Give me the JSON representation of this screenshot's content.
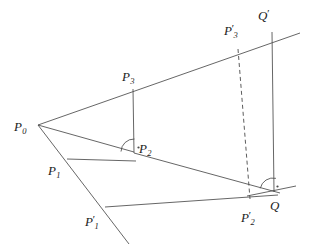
{
  "figure": {
    "background": "#ffffff",
    "stroke_color": "#4a4a4a",
    "label_color": "#222222",
    "width": 312,
    "height": 251,
    "points": [
      {
        "id": "P0",
        "base": "P",
        "sub": "0",
        "prime": false,
        "x": 38,
        "y": 125,
        "label_x": 14,
        "label_y": 118
      },
      {
        "id": "P1",
        "base": "P",
        "sub": "1",
        "prime": false,
        "x": 67,
        "y": 159,
        "label_x": 48,
        "label_y": 162
      },
      {
        "id": "P2",
        "base": "P",
        "sub": "2",
        "prime": false,
        "x": 134,
        "y": 152,
        "label_x": 139,
        "label_y": 140
      },
      {
        "id": "P3",
        "base": "P",
        "sub": "3",
        "prime": false,
        "x": 133,
        "y": 89,
        "label_x": 122,
        "label_y": 68
      },
      {
        "id": "P1p",
        "base": "P",
        "sub": "1",
        "prime": true,
        "x": 105,
        "y": 207,
        "label_x": 85,
        "label_y": 213
      },
      {
        "id": "P2p",
        "base": "P",
        "sub": "2",
        "prime": true,
        "x": 250,
        "y": 197,
        "label_x": 241,
        "label_y": 209
      },
      {
        "id": "P3p",
        "base": "P",
        "sub": "3",
        "prime": true,
        "x": 238,
        "y": 49,
        "label_x": 224,
        "label_y": 22
      },
      {
        "id": "Q",
        "base": "Q",
        "sub": "",
        "prime": false,
        "x": 273,
        "y": 191,
        "label_x": 270,
        "label_y": 197
      },
      {
        "id": "Qp",
        "base": "Q",
        "sub": "",
        "prime": true,
        "x": 272,
        "y": 32,
        "label_x": 258,
        "label_y": 7
      }
    ],
    "segments": [
      {
        "name": "ray-p0-to-qprime",
        "x1": 38,
        "y1": 125,
        "x2": 300,
        "y2": 33,
        "dashed": false
      },
      {
        "name": "segment-p0-to-p2",
        "x1": 38,
        "y1": 125,
        "x2": 134,
        "y2": 152,
        "dashed": false
      },
      {
        "name": "ray-p0-through-p1",
        "x1": 38,
        "y1": 125,
        "x2": 129,
        "y2": 244,
        "dashed": false
      },
      {
        "name": "segment-p3-to-p2",
        "x1": 133,
        "y1": 89,
        "x2": 134,
        "y2": 153,
        "dashed": false
      },
      {
        "name": "segment-p1-to-p2",
        "x1": 67,
        "y1": 159,
        "x2": 136,
        "y2": 161,
        "dashed": false
      },
      {
        "name": "segment-p2-to-q",
        "x1": 134,
        "y1": 153,
        "x2": 280,
        "y2": 193,
        "dashed": false
      },
      {
        "name": "segment-p1prime-to-q",
        "x1": 105,
        "y1": 207,
        "x2": 278,
        "y2": 195,
        "dashed": false
      },
      {
        "name": "segment-qprime-to-q",
        "x1": 272,
        "y1": 32,
        "x2": 274,
        "y2": 192,
        "dashed": false
      },
      {
        "name": "segment-p3prime-to-p2prime",
        "x1": 238,
        "y1": 49,
        "x2": 250,
        "y2": 199,
        "dashed": true
      },
      {
        "name": "tangent-line-at-q",
        "x1": 247,
        "y1": 196,
        "x2": 296,
        "y2": 186,
        "dashed": false
      }
    ],
    "angle_marks": [
      {
        "name": "right-angle-mark-p2",
        "cx": 134,
        "cy": 152,
        "radius": 13,
        "start_deg": 182,
        "end_deg": 272,
        "dot_dx": 4.5,
        "dot_dy": -4.5
      },
      {
        "name": "right-angle-mark-q",
        "cx": 273,
        "cy": 191,
        "radius": 13,
        "start_deg": 192,
        "end_deg": 283,
        "dot_dx": 4.5,
        "dot_dy": -4.5
      }
    ]
  }
}
